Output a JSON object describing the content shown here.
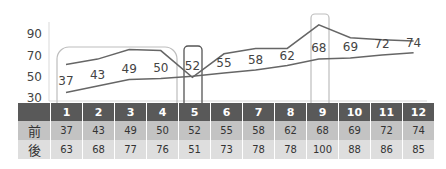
{
  "chart_data": {
    "type": "line",
    "title": "",
    "xlabel": "",
    "ylabel": "",
    "ylim": [
      30,
      90
    ],
    "yticks": [
      90,
      70,
      50,
      30
    ],
    "categories": [
      "1",
      "2",
      "3",
      "4",
      "5",
      "6",
      "7",
      "8",
      "9",
      "10",
      "11",
      "12"
    ],
    "series": [
      {
        "name": "前",
        "values": [
          37,
          43,
          49,
          50,
          52,
          55,
          58,
          62,
          68,
          69,
          72,
          74
        ],
        "data_labels": true
      },
      {
        "name": "後",
        "values": [
          63,
          68,
          77,
          76,
          51,
          73,
          78,
          78,
          100,
          88,
          86,
          85
        ],
        "data_labels": false
      }
    ],
    "highlights": [
      {
        "columns": [
          1,
          4
        ],
        "style": "rounded-light"
      },
      {
        "columns": [
          5,
          5
        ],
        "style": "rounded-dark"
      },
      {
        "columns": [
          9,
          9
        ],
        "style": "rounded-light"
      }
    ],
    "grid": false,
    "legend": "data-table"
  },
  "table": {
    "header": [
      "",
      "1",
      "2",
      "3",
      "4",
      "5",
      "6",
      "7",
      "8",
      "9",
      "10",
      "11",
      "12"
    ],
    "rows": [
      {
        "label": "前",
        "values": [
          "37",
          "43",
          "49",
          "50",
          "52",
          "55",
          "58",
          "62",
          "68",
          "69",
          "72",
          "74"
        ]
      },
      {
        "label": "後",
        "values": [
          "63",
          "68",
          "77",
          "76",
          "51",
          "73",
          "78",
          "78",
          "100",
          "88",
          "86",
          "85"
        ]
      }
    ]
  },
  "colors": {
    "line": "#666666",
    "header_bg": "#595959",
    "row1_bg": "#c3c3c3",
    "row2_bg": "#dedede"
  }
}
